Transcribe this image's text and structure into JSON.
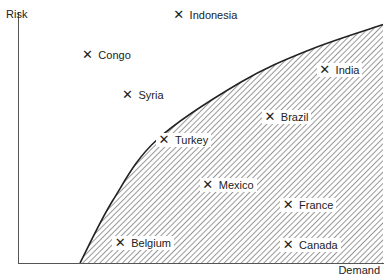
{
  "chart_data": {
    "type": "scatter",
    "title": "",
    "xlabel": "Demand",
    "ylabel": "Risk",
    "xlim": [
      0,
      100
    ],
    "ylim": [
      0,
      100
    ],
    "grid": false,
    "legend": null,
    "marker": "x",
    "points": [
      {
        "label": "Indonesia",
        "x": 44,
        "y": 99
      },
      {
        "label": "Congo",
        "x": 19,
        "y": 83
      },
      {
        "label": "Syria",
        "x": 30,
        "y": 67
      },
      {
        "label": "Turkey",
        "x": 40,
        "y": 49
      },
      {
        "label": "India",
        "x": 84,
        "y": 77
      },
      {
        "label": "Brazil",
        "x": 69,
        "y": 58
      },
      {
        "label": "Mexico",
        "x": 52,
        "y": 31
      },
      {
        "label": "France",
        "x": 74,
        "y": 23
      },
      {
        "label": "Belgium",
        "x": 28,
        "y": 8
      },
      {
        "label": "Canada",
        "x": 74,
        "y": 7
      }
    ],
    "shaded_region": {
      "description": "hatched area below/right of a concave boundary curve",
      "boundary_curve": [
        {
          "x": 17,
          "y": 0
        },
        {
          "x": 26,
          "y": 25
        },
        {
          "x": 38,
          "y": 49
        },
        {
          "x": 61,
          "y": 72
        },
        {
          "x": 80,
          "y": 85
        },
        {
          "x": 100,
          "y": 95
        }
      ]
    }
  },
  "colors": {
    "axis": "#555555",
    "curve": "#222222",
    "hatch": "#333333",
    "text": "#222222",
    "background": "#ffffff"
  }
}
